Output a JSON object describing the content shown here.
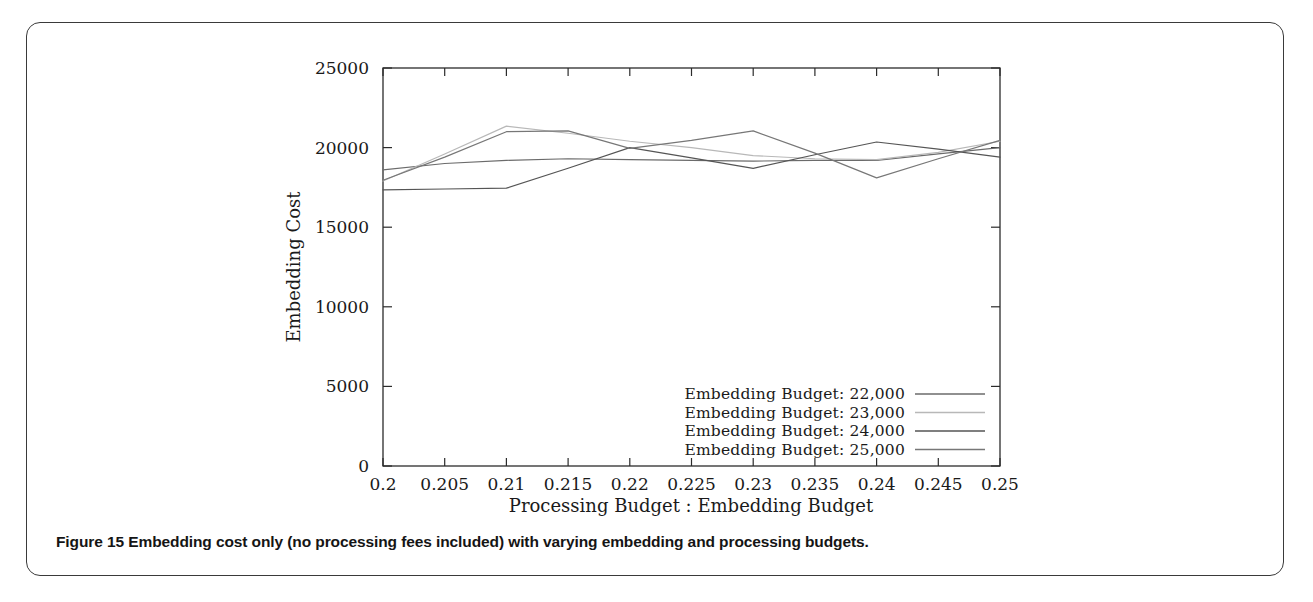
{
  "figure": {
    "caption_label": "Figure 15",
    "caption_text": "Embedding cost only (no processing fees included) with varying embedding and processing budgets."
  },
  "chart_data": {
    "type": "line",
    "title": "",
    "xlabel": "Processing Budget : Embedding Budget",
    "ylabel": "Embedding Cost",
    "xlim": [
      0.2,
      0.25
    ],
    "ylim": [
      0,
      25000
    ],
    "grid": false,
    "legend_position": "bottom-right",
    "xticks": [
      "0.2",
      "0.205",
      "0.21",
      "0.215",
      "0.22",
      "0.225",
      "0.23",
      "0.235",
      "0.24",
      "0.245",
      "0.25"
    ],
    "xtick_values": [
      0.2,
      0.205,
      0.21,
      0.215,
      0.22,
      0.225,
      0.23,
      0.235,
      0.24,
      0.245,
      0.25
    ],
    "yticks": [
      "0",
      "5000",
      "10000",
      "15000",
      "20000",
      "25000"
    ],
    "ytick_values": [
      0,
      5000,
      10000,
      15000,
      20000,
      25000
    ],
    "x": [
      0.2,
      0.205,
      0.21,
      0.215,
      0.22,
      0.225,
      0.23,
      0.235,
      0.24,
      0.245,
      0.25
    ],
    "series": [
      {
        "name": "Embedding Budget: 22,000",
        "color": "#6b6b6b",
        "width": 1.2,
        "values": [
          18600,
          19000,
          19200,
          19300,
          19250,
          19200,
          19150,
          19200,
          19200,
          19600,
          20000
        ]
      },
      {
        "name": "Embedding Budget: 23,000",
        "color": "#b8b8b8",
        "width": 1.2,
        "values": [
          17900,
          19600,
          21350,
          20900,
          20400,
          20000,
          19500,
          19300,
          19250,
          19700,
          20400
        ]
      },
      {
        "name": "Embedding Budget: 24,000",
        "color": "#555555",
        "width": 1.2,
        "values": [
          17350,
          17400,
          17450,
          18700,
          20000,
          19350,
          18700,
          19550,
          20350,
          19900,
          19400
        ]
      },
      {
        "name": "Embedding Budget: 25,000",
        "color": "#777777",
        "width": 1.2,
        "values": [
          17950,
          19400,
          21000,
          21050,
          19950,
          20450,
          21050,
          19650,
          18100,
          19300,
          20450
        ]
      }
    ],
    "legend_entries": [
      "Embedding Budget: 22,000",
      "Embedding Budget: 23,000",
      "Embedding Budget: 24,000",
      "Embedding Budget: 25,000"
    ]
  }
}
